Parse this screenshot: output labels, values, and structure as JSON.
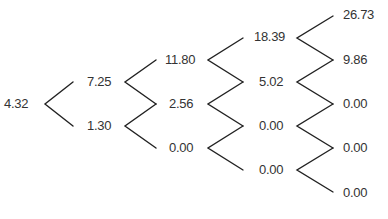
{
  "diagram": {
    "type": "binomial-tree",
    "levels": [
      {
        "step": 0,
        "values": [
          "4.32"
        ]
      },
      {
        "step": 1,
        "values": [
          "7.25",
          "1.30"
        ]
      },
      {
        "step": 2,
        "values": [
          "11.80",
          "2.56",
          "0.00"
        ]
      },
      {
        "step": 3,
        "values": [
          "18.39",
          "5.02",
          "0.00",
          "0.00"
        ]
      },
      {
        "step": 4,
        "values": [
          "26.73",
          "9.86",
          "0.00",
          "0.00",
          "0.00"
        ]
      }
    ],
    "edge_color": "#222222",
    "text_color": "#333333"
  }
}
